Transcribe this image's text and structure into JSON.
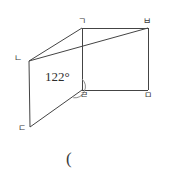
{
  "figure": {
    "type": "geometry-diagram",
    "stroke_color": "#444444",
    "background_color": "#ffffff",
    "vertices": [
      {
        "id": "g",
        "label": "ㄱ",
        "x": 82,
        "y": 28
      },
      {
        "id": "b",
        "label": "ㅂ",
        "x": 148,
        "y": 28
      },
      {
        "id": "n",
        "label": "ㄴ",
        "x": 29,
        "y": 61
      },
      {
        "id": "d",
        "label": "ㄷ",
        "x": 30,
        "y": 127
      },
      {
        "id": "r",
        "label": "ㄹ",
        "x": 82,
        "y": 90
      },
      {
        "id": "m",
        "label": "ㅁ",
        "x": 148,
        "y": 90
      }
    ],
    "edges": [
      {
        "name": "edge-g-b",
        "from": "g",
        "to": "b"
      },
      {
        "name": "edge-b-m",
        "from": "b",
        "to": "m"
      },
      {
        "name": "edge-m-r",
        "from": "m",
        "to": "r"
      },
      {
        "name": "edge-r-g",
        "from": "r",
        "to": "g"
      },
      {
        "name": "edge-n-g",
        "from": "n",
        "to": "g"
      },
      {
        "name": "edge-n-d",
        "from": "n",
        "to": "d"
      },
      {
        "name": "edge-d-r",
        "from": "d",
        "to": "r"
      },
      {
        "name": "diagonal-n-b",
        "from": "n",
        "to": "b"
      }
    ],
    "angle_marks": [
      {
        "name": "angle-at-r",
        "vertex": "r",
        "value": "122°",
        "arc_radius": 11
      }
    ]
  },
  "caption": {
    "paren": "("
  }
}
